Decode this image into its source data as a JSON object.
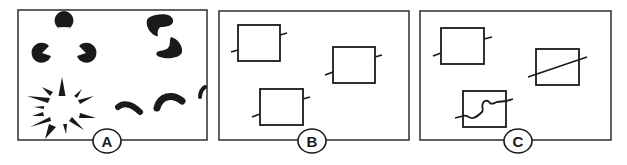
{
  "figure": {
    "colors": {
      "ink": "#1a1a1a",
      "frame": "#3a3a3a",
      "background": "#ffffff"
    },
    "panels": [
      {
        "id": "A",
        "label": "A",
        "contents": [
          "Kanizsa illusory triangle formed by three pac-man shapes",
          "Two kidney shapes suggesting an occluded form",
          "Radial spikes around an illusory circle",
          "Curved arc fragments along a line"
        ]
      },
      {
        "id": "B",
        "label": "B",
        "contents": [
          "Three rectangles with short line stubs on opposite sides"
        ]
      },
      {
        "id": "C",
        "label": "C",
        "contents": [
          "Rectangle with short line stubs",
          "Rectangle crossed by a straight diagonal line",
          "Rectangle crossed by a wavy line"
        ]
      }
    ]
  }
}
